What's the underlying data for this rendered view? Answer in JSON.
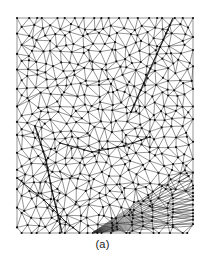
{
  "figure": {
    "caption": "(a)",
    "alt_description": "unstructured triangular mesh",
    "background_color": "#ffffff",
    "edge_color": "#2b2b2b",
    "node_color": "#101010"
  },
  "chart_data": {
    "type": "scatter",
    "title": "",
    "subtitle": "",
    "xlabel": "",
    "ylabel": "",
    "grid": false,
    "legend": null,
    "legend_position": "none",
    "xlim": [
      17,
      193
    ],
    "ylim": [
      18,
      233
    ],
    "axis_visible": false,
    "tick_labels_x": [],
    "tick_labels_y": [],
    "annotations": [
      {
        "text": "(a)",
        "x": 102,
        "y": 248,
        "role": "figure-caption"
      }
    ],
    "domain": {
      "x_min": 17,
      "x_max": 193,
      "y_min": 18,
      "y_max": 233,
      "width": 176,
      "height": 215
    },
    "mesh": {
      "element_type": "triangle",
      "approx_vertex_count": 470,
      "approx_edge_count": 1370,
      "approx_triangle_count": 900,
      "vertex_marker_radius_px": 1.1,
      "edge_width_px": 0.5,
      "nominal_spacing_px": 9.5,
      "seed": 20240517,
      "relaxation_iterations": 3,
      "jitter": 0.42,
      "regions": [
        {
          "name": "bulk",
          "kind": "quasi-uniform",
          "spacing": 9.5,
          "x": [
            17,
            193
          ],
          "y": [
            18,
            233
          ]
        },
        {
          "name": "sliver-fan",
          "kind": "elongated-slivers",
          "anchor_x": 92,
          "anchor_y": 233,
          "x": [
            96,
            193
          ],
          "y": [
            188,
            233
          ],
          "fan_ray_count": 17,
          "fan_angle_min_deg": -4,
          "fan_angle_max_deg": -34
        }
      ],
      "constraints": [
        {
          "name": "upper-right-crack",
          "kind": "straight-segment",
          "emphasis": "heavy",
          "points": [
            [
              173,
              18
            ],
            [
              131,
              112
            ]
          ]
        },
        {
          "name": "lower-left-curve",
          "kind": "polyline",
          "emphasis": "heavy",
          "points": [
            [
              35,
              126
            ],
            [
              46,
              160
            ],
            [
              52,
              191
            ],
            [
              58,
              215
            ],
            [
              62,
              233
            ]
          ]
        },
        {
          "name": "mid-diagonal",
          "kind": "polyline",
          "emphasis": "medium",
          "points": [
            [
              60,
              143
            ],
            [
              92,
              152
            ],
            [
              124,
              146
            ],
            [
              150,
              137
            ]
          ]
        },
        {
          "name": "left-lower-diagonal",
          "kind": "polyline",
          "emphasis": "medium",
          "points": [
            [
              17,
              178
            ],
            [
              44,
              200
            ],
            [
              66,
              222
            ],
            [
              80,
              233
            ]
          ]
        }
      ]
    }
  }
}
